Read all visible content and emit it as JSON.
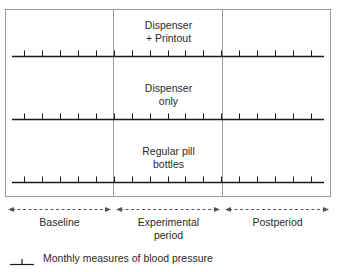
{
  "diagram": {
    "groups": [
      {
        "label_line1": "Dispenser",
        "label_line2": "+ Printout"
      },
      {
        "label_line1": "Dispenser",
        "label_line2": "only"
      },
      {
        "label_line1": "Regular pill",
        "label_line2": "bottles"
      }
    ],
    "phases": [
      {
        "label_line1": "Baseline",
        "label_line2": ""
      },
      {
        "label_line1": "Experimental",
        "label_line2": "period"
      },
      {
        "label_line1": "Postperiod",
        "label_line2": ""
      }
    ],
    "ticks_per_timeline": 17,
    "legend": {
      "symbol": "tick-mark",
      "text": "Monthly measures of blood pressure"
    },
    "colors": {
      "line": "#1a1a1a",
      "border": "#9a9a9a",
      "divider": "#9a9a9a",
      "arrow": "#555555"
    }
  }
}
